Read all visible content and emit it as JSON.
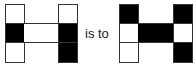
{
  "connector_text": "is to",
  "colors": {
    "filled": "#000000",
    "empty": "#ffffff",
    "border": "#333333"
  },
  "figures": [
    {
      "name": "source-figure",
      "left_column": [
        "white",
        "black",
        "white"
      ],
      "crossbar": "white",
      "right_column": [
        "white",
        "black",
        "black"
      ]
    },
    {
      "name": "target-figure",
      "left_column": [
        "black",
        "white",
        "white"
      ],
      "crossbar": "black",
      "right_column": [
        "black",
        "white",
        "black"
      ]
    }
  ]
}
